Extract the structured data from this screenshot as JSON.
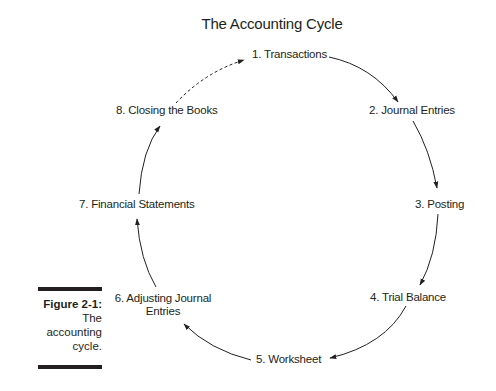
{
  "diagram": {
    "title": "The Accounting Cycle",
    "type": "cycle",
    "nodes": [
      {
        "id": 1,
        "label": "1. Transactions"
      },
      {
        "id": 2,
        "label": "2. Journal Entries"
      },
      {
        "id": 3,
        "label": "3. Posting"
      },
      {
        "id": 4,
        "label": "4. Trial Balance"
      },
      {
        "id": 5,
        "label": "5. Worksheet"
      },
      {
        "id": 6,
        "label_line1": "6. Adjusting Journal",
        "label_line2": "Entries"
      },
      {
        "id": 7,
        "label": "7. Financial Statements"
      },
      {
        "id": 8,
        "label": "8. Closing the Books"
      }
    ],
    "edges": [
      {
        "from": 1,
        "to": 2,
        "style": "solid"
      },
      {
        "from": 2,
        "to": 3,
        "style": "solid"
      },
      {
        "from": 3,
        "to": 4,
        "style": "solid"
      },
      {
        "from": 4,
        "to": 5,
        "style": "solid"
      },
      {
        "from": 5,
        "to": 6,
        "style": "solid"
      },
      {
        "from": 6,
        "to": 7,
        "style": "solid"
      },
      {
        "from": 7,
        "to": 8,
        "style": "solid"
      },
      {
        "from": 8,
        "to": 1,
        "style": "dashed"
      }
    ]
  },
  "caption": {
    "figure": "Figure 2-1:",
    "text_line1": "The",
    "text_line2": "accounting",
    "text_line3": "cycle."
  },
  "colors": {
    "ink": "#231f20",
    "background": "#ffffff"
  }
}
